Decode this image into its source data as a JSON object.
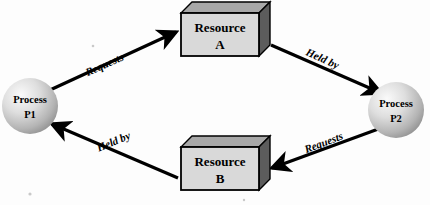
{
  "diagram": {
    "type": "resource-allocation-graph",
    "background_color": "#fdfdfd",
    "nodes": [
      {
        "id": "resource_a",
        "shape": "cube",
        "line1": "Resource",
        "line2": "A",
        "front_color": "#d9d9d9",
        "top_color": "#a8a8a8",
        "side_color": "#5c5c5c",
        "outline_color": "#000000",
        "x": 181,
        "y": 13,
        "width": 78,
        "height": 43,
        "depth": 11
      },
      {
        "id": "resource_b",
        "shape": "cube",
        "line1": "Resource",
        "line2": "B",
        "front_color": "#d9d9d9",
        "top_color": "#a8a8a8",
        "side_color": "#5c5c5c",
        "outline_color": "#000000",
        "x": 181,
        "y": 147,
        "width": 78,
        "height": 43,
        "depth": 11
      },
      {
        "id": "process_p1",
        "shape": "circle",
        "line1": "Process",
        "line2": "P1",
        "fill_light": "#f2f2f2",
        "fill_dark": "#9a9a9a",
        "cx": 30,
        "cy": 106,
        "r": 28
      },
      {
        "id": "process_p2",
        "shape": "circle",
        "line1": "Process",
        "line2": "P2",
        "fill_light": "#f2f2f2",
        "fill_dark": "#9a9a9a",
        "cx": 396,
        "cy": 110,
        "r": 28
      }
    ],
    "edges": [
      {
        "id": "p1_requests_a",
        "label": "Requests",
        "from": "process_p1",
        "to": "resource_a",
        "x1": 50,
        "y1": 90,
        "x2": 176,
        "y2": 32,
        "label_x": 106,
        "label_y": 68,
        "label_rotation": -24,
        "color": "#000000",
        "width": 3.2
      },
      {
        "id": "a_heldby_p2",
        "label": "Held by",
        "from": "resource_a",
        "to": "process_p2",
        "x1": 271,
        "y1": 45,
        "x2": 381,
        "y2": 93,
        "label_x": 321,
        "label_y": 62,
        "label_rotation": 24,
        "color": "#000000",
        "width": 3.2
      },
      {
        "id": "p2_requests_b",
        "label": "Requests",
        "from": "process_p2",
        "to": "resource_b",
        "x1": 381,
        "y1": 128,
        "x2": 272,
        "y2": 168,
        "label_x": 325,
        "label_y": 146,
        "label_rotation": -21,
        "color": "#000000",
        "width": 3.2
      },
      {
        "id": "b_heldby_p1",
        "label": "Held by",
        "from": "resource_b",
        "to": "process_p1",
        "x1": 178,
        "y1": 178,
        "x2": 52,
        "y2": 124,
        "label_x": 115,
        "label_y": 145,
        "label_rotation": -23,
        "color": "#000000",
        "width": 3.2
      }
    ],
    "specks": [
      {
        "cx": 30,
        "cy": 194,
        "r": 1.6
      },
      {
        "cx": 93,
        "cy": 46,
        "r": 1.3
      },
      {
        "cx": 244,
        "cy": 200,
        "r": 1.2
      }
    ]
  }
}
